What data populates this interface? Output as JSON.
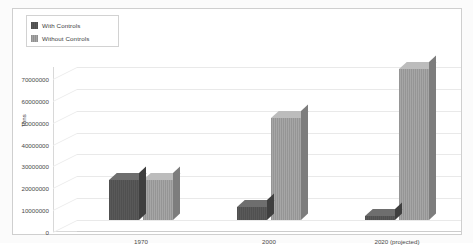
{
  "chart_data": {
    "type": "bar",
    "title": "",
    "xlabel": "",
    "ylabel": "Tons",
    "categories": [
      "1970",
      "2000",
      "2020 (projected)"
    ],
    "series": [
      {
        "name": "With Controls",
        "values": [
          18500000,
          6000000,
          2000000
        ],
        "color": "#595959"
      },
      {
        "name": "Without Controls",
        "values": [
          18500000,
          46500000,
          69000000
        ],
        "color": "#a6a6a6"
      }
    ],
    "ylim": [
      0,
      70000000
    ],
    "ytick_labels": [
      "70000000",
      "60000000",
      "50000000",
      "40000000",
      "30000000",
      "20000000",
      "10000000",
      "0"
    ],
    "ytick_values": [
      70000000,
      60000000,
      50000000,
      40000000,
      30000000,
      20000000,
      10000000,
      0
    ],
    "grid": true,
    "legend_position": "top-left",
    "three_d": true
  },
  "legend": {
    "items": [
      {
        "label": "With Controls",
        "swatch": "dark-swatch-icon"
      },
      {
        "label": "Without Controls",
        "swatch": "light-swatch-icon"
      }
    ]
  },
  "colors": {
    "with_controls": "#595959",
    "without_controls": "#a6a6a6",
    "gridline": "#e9e9e9",
    "frame": "#cfcfcf",
    "text": "#3d3d3d",
    "background": "#ffffff"
  }
}
